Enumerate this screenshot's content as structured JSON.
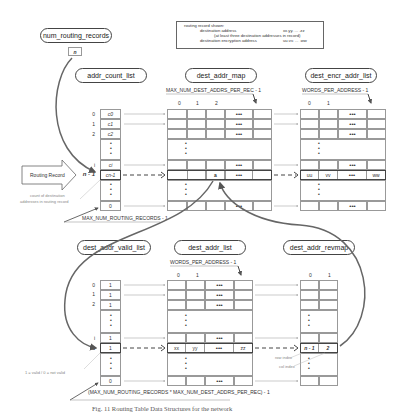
{
  "nodes": {
    "num_routing_records": "num_routing_records",
    "n_box": "n",
    "addr_count_list": "addr_count_list",
    "dest_addr_map": "dest_addr_map",
    "dest_encr_addr_list": "dest_encr_addr_list",
    "dest_addr_valid_list": "dest_addr_valid_list",
    "dest_addr_list": "dest_addr_list",
    "dest_addr_revmap": "dest_addr_revmap"
  },
  "legend": {
    "line1_label": "routing record shown:",
    "line2_label": "destination address",
    "line2_value": "xx.yy. ... .zz",
    "line3_label": "(at least three destination addresses in record)",
    "line4_label": "destination encryption address",
    "line4_value": "uu.vv. ... .ww"
  },
  "labels": {
    "max_dest_addrs": "MAX_NUM_DEST_ADDRS_PER_REC - 1",
    "words_per_address_top": "WORDS_PER_ADDRESS - 1",
    "words_per_address_bottom": "WORDS_PER_ADDRESS - 1",
    "max_routing_records": "MAX_NUM_ROUTING_RECORDS - 1",
    "max_combined": "(MAX_NUM_ROUTING_RECORDS * MAX_NUM_DEST_ADDRS_PER_REC) - 1",
    "routing_record": "Routing Record",
    "count_note_1": "count of destination",
    "count_note_2": "addresses in routing record",
    "valid_note": "1 = valid / 0 = not valid",
    "row_index_note": "row index",
    "col_index_note": "col index",
    "caption": "Fig. 11 Routing Table Data Structures for the network"
  },
  "addr_count_list": {
    "indices": [
      "0",
      "1",
      "2",
      "i",
      "n - 1"
    ],
    "values": [
      "c0",
      "c1",
      "c2",
      "ci",
      "cn-1",
      "0"
    ]
  },
  "dest_addr_map": {
    "col_headers": [
      "0",
      "1",
      "2"
    ],
    "highlight_value": "a",
    "ellipsis": "•••"
  },
  "dest_encr_addr_list": {
    "col_headers": [
      "0",
      "1"
    ],
    "highlight_row": [
      "uu",
      "vv",
      "•••",
      "ww"
    ]
  },
  "dest_addr_valid_list": {
    "indices": [
      "0",
      "1",
      "2",
      "i",
      "a"
    ],
    "values": [
      "1",
      "1",
      "1",
      "1",
      "1",
      "0"
    ]
  },
  "dest_addr_list": {
    "col_headers": [
      "0",
      "1"
    ],
    "highlight_row": [
      "xx",
      "yy",
      "•••",
      "zz"
    ]
  },
  "dest_addr_revmap": {
    "col_headers": [
      "0",
      "1"
    ],
    "highlight_row": [
      "n - 1",
      "2"
    ]
  },
  "colors": {
    "arrow": "#666666",
    "border": "#999999",
    "highlight_border": "#444444"
  }
}
